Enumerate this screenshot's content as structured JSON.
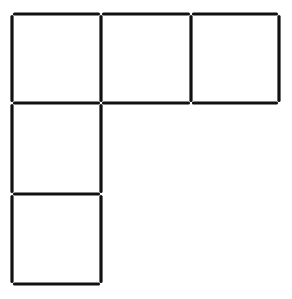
{
  "puzzle": {
    "type": "matchstick",
    "stick_color": "#111111",
    "background": "#ffffff",
    "grid_x": [
      12,
      101,
      191,
      279
    ],
    "grid_y": [
      14,
      103,
      194,
      284
    ],
    "squares": [
      {
        "col": 0,
        "row": 0
      },
      {
        "col": 1,
        "row": 0
      },
      {
        "col": 2,
        "row": 0
      },
      {
        "col": 0,
        "row": 1
      },
      {
        "col": 0,
        "row": 2
      }
    ],
    "stick_count": 16
  }
}
